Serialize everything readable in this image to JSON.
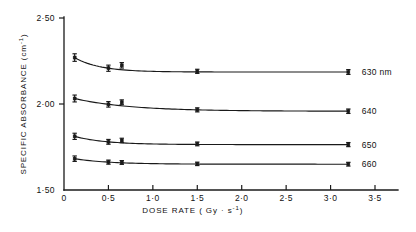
{
  "chart_data": {
    "type": "line",
    "title": "",
    "xlabel": "DOSE RATE ( Gy · s",
    "xlabel_sup": "-1",
    "xlabel_tail": ")",
    "ylabel": "SPECIFIC  ABSORBANCE  (cm",
    "ylabel_sup": "-1",
    "ylabel_tail": ")",
    "xlim": [
      0,
      3.7
    ],
    "ylim": [
      1.5,
      2.5
    ],
    "grid": false,
    "legend_position": "right-of-curves",
    "xticks": [
      0,
      0.5,
      1.0,
      1.5,
      2.0,
      2.5,
      3.0,
      3.5
    ],
    "xtick_labels": [
      "0",
      "0·5",
      "1·0",
      "1·5",
      "2·0",
      "2·5",
      "3·0",
      "3·5"
    ],
    "yticks": [
      1.5,
      2.0,
      2.5
    ],
    "ytick_labels": [
      "1·50",
      "2·00",
      "2·50"
    ],
    "series": [
      {
        "name": "630 nm",
        "label": "630 nm",
        "x": [
          0.12,
          0.5,
          0.65,
          1.5,
          3.2
        ],
        "values": [
          2.27,
          2.208,
          2.225,
          2.19,
          2.186
        ],
        "errors": [
          0.022,
          0.018,
          0.016,
          0.012,
          0.014
        ],
        "label_x": 3.35,
        "label_y": 2.186
      },
      {
        "name": "640",
        "label": "640",
        "x": [
          0.12,
          0.5,
          0.65,
          1.5,
          3.2
        ],
        "values": [
          2.032,
          1.998,
          2.01,
          1.966,
          1.958
        ],
        "errors": [
          0.02,
          0.016,
          0.014,
          0.012,
          0.013
        ],
        "label_x": 3.35,
        "label_y": 1.958
      },
      {
        "name": "650",
        "label": "650",
        "x": [
          0.12,
          0.5,
          0.65,
          1.5,
          3.2
        ],
        "values": [
          1.812,
          1.78,
          1.788,
          1.768,
          1.764
        ],
        "errors": [
          0.018,
          0.014,
          0.013,
          0.011,
          0.012
        ],
        "label_x": 3.35,
        "label_y": 1.764
      },
      {
        "name": "660",
        "label": "660",
        "x": [
          0.12,
          0.5,
          0.65,
          1.5,
          3.2
        ],
        "values": [
          1.682,
          1.662,
          1.66,
          1.652,
          1.65
        ],
        "errors": [
          0.016,
          0.012,
          0.011,
          0.01,
          0.011
        ],
        "label_x": 3.35,
        "label_y": 1.65
      }
    ]
  },
  "colors": {
    "ink": "#1a1a1a",
    "background": "#ffffff"
  }
}
